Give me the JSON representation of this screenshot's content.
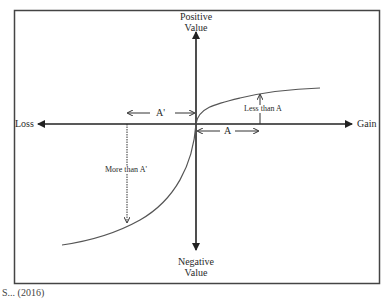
{
  "figure": {
    "type": "value-function-diagram",
    "labels": {
      "positive_value_line1": "Positive",
      "positive_value_line2": "Value",
      "negative_value_line1": "Negative",
      "negative_value_line2": "Value",
      "loss": "Loss",
      "gain": "Gain",
      "a_prime": "A'",
      "a": "A",
      "less_than_a": "Less than A",
      "more_than_a_prime": "More than A'"
    },
    "colors": {
      "line": "#222222",
      "curve": "#555555",
      "border": "#444444"
    }
  },
  "caption": "S... (2016)"
}
